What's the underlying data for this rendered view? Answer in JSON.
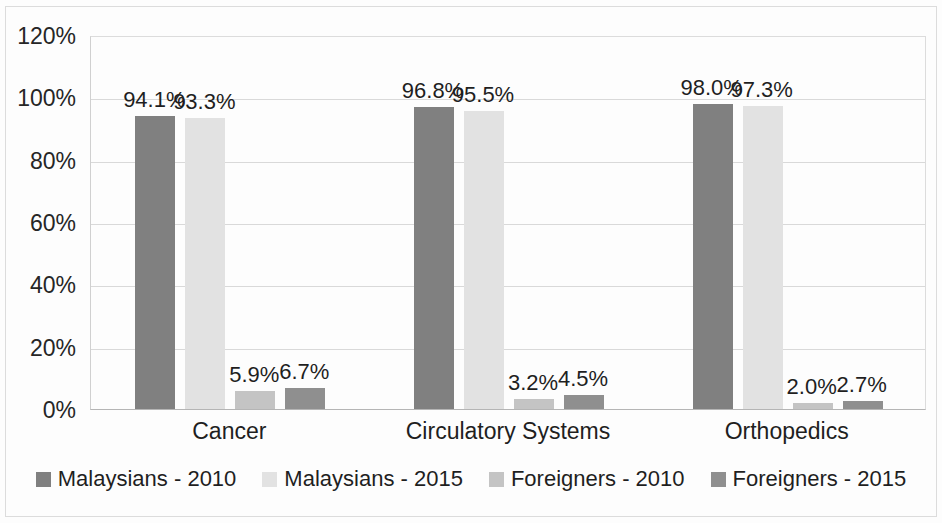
{
  "chart_data": {
    "type": "bar",
    "title": "",
    "subtitle": "",
    "xlabel": "",
    "ylabel": "",
    "categories": [
      "Cancer",
      "Circulatory Systems",
      "Orthopedics"
    ],
    "series": [
      {
        "name": "Malaysians - 2010",
        "color": "#808080",
        "values": [
          94.1,
          96.8,
          98.0
        ],
        "labels": [
          "94.1%",
          "93.3%",
          "98.0%"
        ]
      },
      {
        "name": "Malaysians - 2015",
        "color": "#e2e2e2",
        "values": [
          93.3,
          95.5,
          97.3
        ],
        "labels": [
          "93.3%",
          "95.5%",
          "97.3%"
        ]
      },
      {
        "name": "Foreigners - 2010",
        "color": "#c4c4c4",
        "values": [
          5.9,
          3.2,
          2.0
        ],
        "labels": [
          "5.9%",
          "3.2%",
          "2.0%"
        ]
      },
      {
        "name": "Foreigners - 2015",
        "color": "#8f8f8f",
        "values": [
          6.7,
          4.5,
          2.7
        ],
        "labels": [
          "6.7%",
          "4.5%",
          "2.7%"
        ]
      }
    ],
    "point_labels": [
      [
        "94.1%",
        "93.3%",
        "5.9%",
        "6.7%"
      ],
      [
        "96.8%",
        "95.5%",
        "3.2%",
        "4.5%"
      ],
      [
        "98.0%",
        "97.3%",
        "2.0%",
        "2.7%"
      ]
    ],
    "ylim": [
      0,
      120
    ],
    "ytick_values": [
      0,
      20,
      40,
      60,
      80,
      100,
      120
    ],
    "ytick_labels": [
      "0%",
      "20%",
      "40%",
      "60%",
      "80%",
      "100%",
      "120%"
    ],
    "grid": true,
    "grid_color": "#d9d9d9",
    "legend_position": "bottom",
    "plot_background": "#ffffff"
  },
  "axis": {
    "y_ticks": [
      "120%",
      "100%",
      "80%",
      "60%",
      "40%",
      "20%",
      "0%"
    ]
  },
  "categories": {
    "items": [
      {
        "label": "Cancer"
      },
      {
        "label": "Circulatory Systems"
      },
      {
        "label": "Orthopedics"
      }
    ]
  },
  "legend": {
    "items": [
      {
        "label": "Malaysians - 2010",
        "color": "#808080"
      },
      {
        "label": "Malaysians - 2015",
        "color": "#e2e2e2"
      },
      {
        "label": "Foreigners - 2010",
        "color": "#c4c4c4"
      },
      {
        "label": "Foreigners - 2015",
        "color": "#8f8f8f"
      }
    ]
  }
}
